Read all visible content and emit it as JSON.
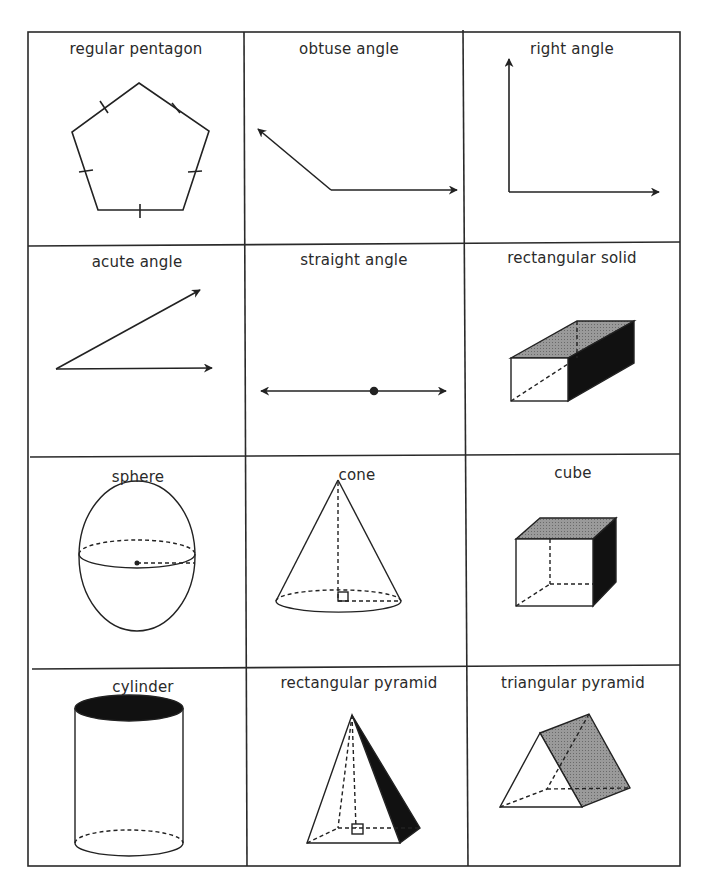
{
  "chart": {
    "layout": "3 columns x 4 rows grid of geometry terms",
    "colors": {
      "line": "#222222",
      "shade_gray": "#8a8a8a",
      "shade_black": "#111111",
      "background": "#ffffff"
    }
  },
  "cells": [
    {
      "row": 1,
      "col": 1,
      "label": "regular pentagon",
      "figure": "pentagon-with-tick-marks"
    },
    {
      "row": 1,
      "col": 2,
      "label": "obtuse angle",
      "figure": "obtuse-angle-rays"
    },
    {
      "row": 1,
      "col": 3,
      "label": "right angle",
      "figure": "right-angle-rays"
    },
    {
      "row": 2,
      "col": 1,
      "label": "acute angle",
      "figure": "acute-angle-rays"
    },
    {
      "row": 2,
      "col": 2,
      "label": "straight angle",
      "figure": "line-with-vertex-point"
    },
    {
      "row": 2,
      "col": 3,
      "label": "rectangular solid",
      "figure": "rectangular-prism"
    },
    {
      "row": 3,
      "col": 1,
      "label": "sphere",
      "figure": "sphere-with-radius"
    },
    {
      "row": 3,
      "col": 2,
      "label": "cone",
      "figure": "cone-with-height"
    },
    {
      "row": 3,
      "col": 3,
      "label": "cube",
      "figure": "cube"
    },
    {
      "row": 4,
      "col": 1,
      "label": "cylinder",
      "figure": "cylinder"
    },
    {
      "row": 4,
      "col": 2,
      "label": "rectangular pyramid",
      "figure": "rectangular-pyramid"
    },
    {
      "row": 4,
      "col": 3,
      "label": "triangular pyramid",
      "figure": "triangular-prism-shape"
    }
  ]
}
